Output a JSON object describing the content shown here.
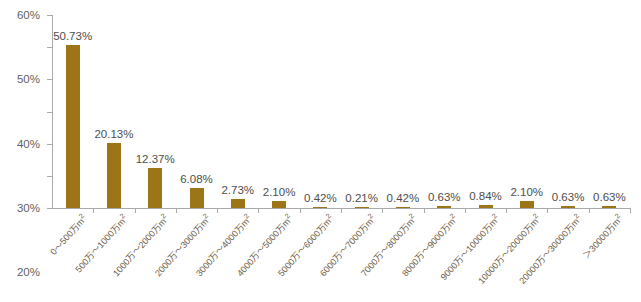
{
  "chart_data": {
    "type": "bar",
    "title": "",
    "subtitle": "",
    "xlabel": "",
    "ylabel": "",
    "ylim": [
      0,
      60
    ],
    "ytick_values": [
      0,
      10,
      20,
      30,
      40,
      50,
      60
    ],
    "ytick_labels": [
      "0%",
      "10%",
      "20%",
      "30%",
      "40%",
      "50%",
      "60%"
    ],
    "grid": false,
    "legend": null,
    "bar_color": "#9b7516",
    "categories": [
      "0～500万m²",
      "500万～1000万m²",
      "1000万～2000万m²",
      "2000万～3000万m²",
      "3000万～4000万m²",
      "4000万～5000万m²",
      "5000万～6000万m²",
      "6000万～7000万m²",
      "7000万～8000万m²",
      "8000万～9000万m²",
      "9000万～10000万m²",
      "10000万～20000万m²",
      "20000万～30000万m²",
      "＞30000万m²"
    ],
    "values": [
      50.73,
      20.13,
      12.37,
      6.08,
      2.73,
      2.1,
      0.42,
      0.21,
      0.42,
      0.63,
      0.84,
      2.1,
      0.63,
      0.63
    ],
    "data_labels": [
      "50.73%",
      "20.13%",
      "12.37%",
      "6.08%",
      "2.73%",
      "2.10%",
      "0.42%",
      "0.21%",
      "0.42%",
      "0.63%",
      "0.84%",
      "2.10%",
      "0.63%",
      "0.63%"
    ]
  }
}
